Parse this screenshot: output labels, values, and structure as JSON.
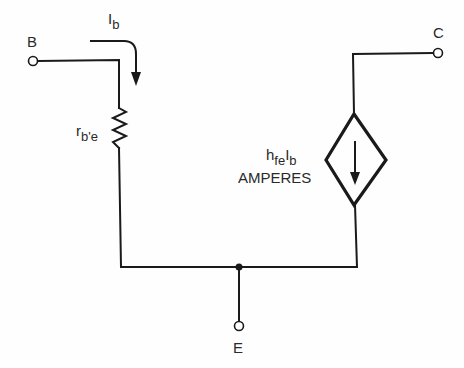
{
  "diagram": {
    "title": "",
    "terminals": {
      "base": "B",
      "collector": "C",
      "emitter": "E"
    },
    "current_label": {
      "main": "I",
      "sub": "b"
    },
    "resistor_label": {
      "main": "r",
      "sub": "b'e"
    },
    "source_label": {
      "line1_h": "h",
      "line1_sub1": "fe",
      "line1_I": "I",
      "line1_sub2": "b",
      "line2": "AMPERES"
    },
    "colors": {
      "stroke": "#1a1a1a",
      "background": "#fefefe"
    }
  }
}
